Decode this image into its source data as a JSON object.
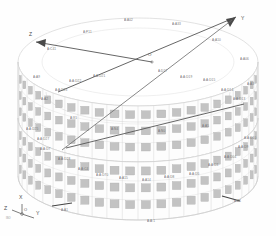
{
  "drawing": {
    "title": "Cylindrical ring assembly isometric view",
    "background": "#fefefe",
    "panel_fill": "#c3c3c3",
    "panel_stroke": "#b0b0b0",
    "frame_stroke": "#d2d2d2",
    "axis_stroke": "#555555",
    "label_color": "#6e6e6e"
  },
  "axes": {
    "origin_label": "O",
    "z_label": "Z",
    "y_label": "Y",
    "x_label": "X"
  },
  "triad": {
    "x_label": "X",
    "y_label": "Y",
    "z_label": "Z",
    "origin_label": "O",
    "note": "ISO"
  },
  "part_labels": [
    {
      "text": "A:A02",
      "x": 124,
      "y": 18,
      "rot": 0
    },
    {
      "text": "A:A33",
      "x": 172,
      "y": 22,
      "rot": 0
    },
    {
      "text": "A:P11",
      "x": 83,
      "y": 30,
      "rot": 0
    },
    {
      "text": "A:A10",
      "x": 212,
      "y": 38,
      "rot": 0
    },
    {
      "text": "A:C41",
      "x": 47,
      "y": 47,
      "rot": 0
    },
    {
      "text": "A:A06",
      "x": 240,
      "y": 57,
      "rot": 0
    },
    {
      "text": "A:A9",
      "x": 33,
      "y": 75,
      "rot": 0
    },
    {
      "text": "A:D17",
      "x": 158,
      "y": 69,
      "rot": 0
    },
    {
      "text": "A:A:D21",
      "x": 93,
      "y": 74,
      "rot": 0
    },
    {
      "text": "A:A:D19",
      "x": 180,
      "y": 75,
      "rot": 0
    },
    {
      "text": "A:A:D15",
      "x": 203,
      "y": 78,
      "rot": 0
    },
    {
      "text": "A:A:D22",
      "x": 69,
      "y": 79,
      "rot": 0
    },
    {
      "text": "A:A3",
      "x": 247,
      "y": 82,
      "rot": 0
    },
    {
      "text": "A:A:D23",
      "x": 55,
      "y": 88,
      "rot": 0
    },
    {
      "text": "A:A:D14",
      "x": 221,
      "y": 88,
      "rot": 0
    },
    {
      "text": "A:A2",
      "x": 41,
      "y": 97,
      "rot": 0
    },
    {
      "text": "A:A:D13",
      "x": 233,
      "y": 97,
      "rot": 0
    },
    {
      "text": "A:X1",
      "x": 70,
      "y": 116,
      "rot": 0
    },
    {
      "text": "A:N4",
      "x": 111,
      "y": 127,
      "rot": 0
    },
    {
      "text": "A:N0",
      "x": 158,
      "y": 129,
      "rot": 0
    },
    {
      "text": "A:A5",
      "x": 202,
      "y": 124,
      "rot": 0
    },
    {
      "text": "A:A:D25",
      "x": 26,
      "y": 127,
      "rot": 0
    },
    {
      "text": "A:A:D10",
      "x": 244,
      "y": 136,
      "rot": 0
    },
    {
      "text": "A:A:D27",
      "x": 37,
      "y": 137,
      "rot": 0
    },
    {
      "text": "A:A:D9",
      "x": 238,
      "y": 145,
      "rot": 0
    },
    {
      "text": "A:A:D7",
      "x": 40,
      "y": 147,
      "rot": 0
    },
    {
      "text": "A:A:D04",
      "x": 224,
      "y": 155,
      "rot": 0
    },
    {
      "text": "A:A:D28",
      "x": 58,
      "y": 157,
      "rot": 0
    },
    {
      "text": "A:A:D3",
      "x": 208,
      "y": 163,
      "rot": 0
    },
    {
      "text": "A:A:C4",
      "x": 78,
      "y": 167,
      "rot": 0
    },
    {
      "text": "A:A:D70",
      "x": 96,
      "y": 173,
      "rot": 0
    },
    {
      "text": "A:A:D5",
      "x": 189,
      "y": 172,
      "rot": 0
    },
    {
      "text": "A:A15",
      "x": 119,
      "y": 176,
      "rot": 0
    },
    {
      "text": "A:A14",
      "x": 142,
      "y": 178,
      "rot": 0
    },
    {
      "text": "A:A:D8",
      "x": 164,
      "y": 175,
      "rot": 0
    },
    {
      "text": "A:A1",
      "x": 61,
      "y": 208,
      "rot": 0
    },
    {
      "text": "A:A1",
      "x": 234,
      "y": 199,
      "rot": 0
    },
    {
      "text": "A:A:1",
      "x": 147,
      "y": 219,
      "rot": 0
    }
  ],
  "chart_data": {
    "type": "diagram",
    "tiers": 2,
    "panel_columns": 24,
    "panel_rows_per_tier": 3
  }
}
